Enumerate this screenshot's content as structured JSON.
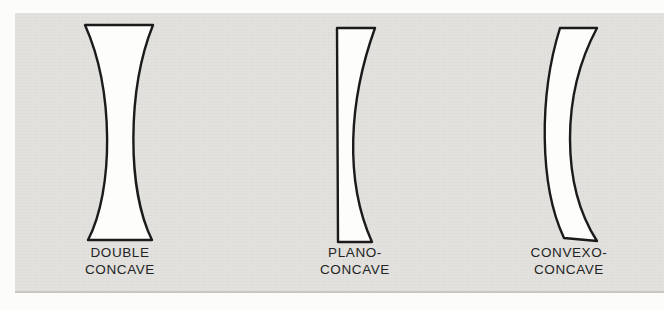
{
  "figure": {
    "background_color": "#fcfcfa",
    "panel_color": "#e2e1de",
    "panel_edge_color": "#c7c6c1",
    "outline_color": "#1b1b1b",
    "lens_fill_color": "#fdfdfc",
    "label_color": "#242424"
  },
  "lenses": [
    {
      "name": "double-concave",
      "label_line1": "DOUBLE",
      "label_line2": "CONCAVE",
      "path": "M 85 25 L 153 25 C 127 90 127 190 152 240 L 88 240 C 114 190 114 90 85 25 Z"
    },
    {
      "name": "plano-concave",
      "label_line1": "PLANO-",
      "label_line2": "CONCAVE",
      "path": "M 337 28 L 375 28 C 349 100 344 180 372 242 L 338 242 Z"
    },
    {
      "name": "convexo-concave",
      "label_line1": "CONVEXO-",
      "label_line2": "CONCAVE",
      "path": "M 560 28 L 597 28 C 561 95 561 185 597 241 L 564 238 C 539 185 539 95 560 28 Z"
    }
  ]
}
